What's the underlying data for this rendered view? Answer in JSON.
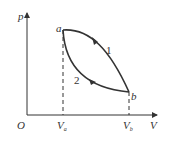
{
  "diagram": {
    "axes": {
      "y_label": "p",
      "x_label": "V",
      "origin_label": "O"
    },
    "points": {
      "a": "a",
      "b": "b"
    },
    "ticks": {
      "va": "V",
      "va_sub": "a",
      "vb": "V",
      "vb_sub": "b"
    },
    "paths": {
      "path1": "1",
      "path2": "2"
    },
    "colors": {
      "line": "#333333"
    }
  }
}
